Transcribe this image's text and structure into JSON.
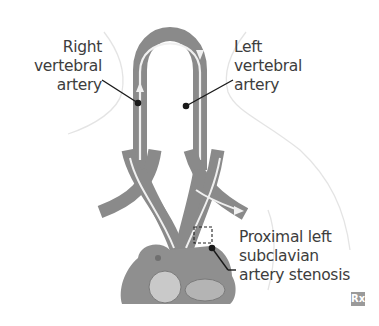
{
  "figure": {
    "labels": {
      "right_vertebral": [
        "Right",
        "vertebral",
        "artery"
      ],
      "left_vertebral": [
        "Left",
        "vertebral",
        "artery"
      ],
      "stenosis": [
        "Proximal left",
        "subclavian",
        "artery stenosis"
      ]
    },
    "badge": "Rx",
    "colors": {
      "artery": "#8c8c8c",
      "artery_dark": "#6f6f6f",
      "flow_arrow": "#f2f2f2",
      "outline": "#e2e2e2",
      "leader": "#1a1a1a",
      "text": "#3d3d3d"
    }
  }
}
